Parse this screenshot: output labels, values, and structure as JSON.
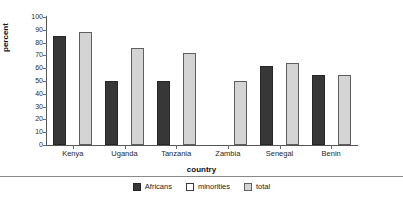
{
  "chart_data": {
    "type": "bar",
    "title": "",
    "xlabel": "country",
    "ylabel": "percent",
    "ylim": [
      0,
      100
    ],
    "yticks": [
      0,
      10,
      20,
      30,
      40,
      50,
      60,
      70,
      80,
      90,
      100
    ],
    "grid": false,
    "legend_position": "bottom",
    "categories": [
      "Kenya",
      "Uganda",
      "Tanzania",
      "Zambia",
      "Senegal",
      "Benin"
    ],
    "series": [
      {
        "name": "Africans",
        "color": "#373737",
        "values": [
          85,
          50,
          50,
          null,
          62,
          55
        ]
      },
      {
        "name": "minorities",
        "color": "#ffffff",
        "values": [
          null,
          null,
          null,
          null,
          null,
          null
        ]
      },
      {
        "name": "total",
        "color": "#d4d4d4",
        "values": [
          88,
          76,
          72,
          50,
          64,
          55
        ]
      }
    ]
  },
  "legend": {
    "items": [
      {
        "label": "Africans",
        "swatch": "s-africans"
      },
      {
        "label": "minorities",
        "swatch": "s-minorities"
      },
      {
        "label": "total",
        "swatch": "s-total"
      }
    ]
  }
}
